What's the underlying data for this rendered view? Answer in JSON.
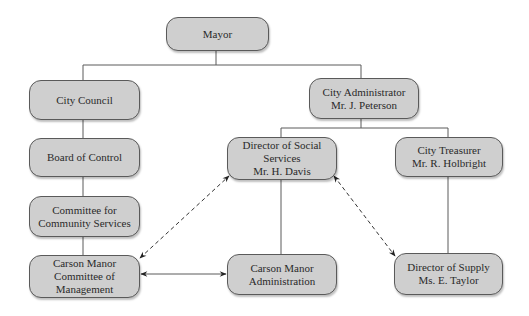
{
  "diagram": {
    "type": "organizational-chart",
    "colors": {
      "box_fill": "#cfcfcf",
      "box_border": "#5a5a5a",
      "line": "#5a5a5a",
      "text": "#2a2a2a",
      "background": "#ffffff"
    },
    "nodes": [
      {
        "id": "mayor",
        "lines": [
          "Mayor"
        ],
        "x": 166,
        "y": 17,
        "w": 103,
        "h": 34
      },
      {
        "id": "city-council",
        "lines": [
          "City Council"
        ],
        "x": 29,
        "y": 80,
        "w": 111,
        "h": 40
      },
      {
        "id": "city-administrator",
        "lines": [
          "City Administrator",
          "Mr. J. Peterson"
        ],
        "x": 309,
        "y": 78,
        "w": 110,
        "h": 41
      },
      {
        "id": "board-of-control",
        "lines": [
          "Board of Control"
        ],
        "x": 29,
        "y": 138,
        "w": 111,
        "h": 39
      },
      {
        "id": "director-social-services",
        "lines": [
          "Director of Social",
          "Services",
          "Mr. H. Davis"
        ],
        "x": 227,
        "y": 137,
        "w": 110,
        "h": 43
      },
      {
        "id": "city-treasurer",
        "lines": [
          "City Treasurer",
          "Mr. R. Holbright"
        ],
        "x": 395,
        "y": 137,
        "w": 108,
        "h": 40
      },
      {
        "id": "committee-community-services",
        "lines": [
          "Committee for",
          "Community Services"
        ],
        "x": 29,
        "y": 196,
        "w": 111,
        "h": 41
      },
      {
        "id": "carson-manor-committee",
        "lines": [
          "Carson Manor",
          "Committee of",
          "Management"
        ],
        "x": 29,
        "y": 255,
        "w": 111,
        "h": 43
      },
      {
        "id": "carson-manor-administration",
        "lines": [
          "Carson Manor",
          "Administration"
        ],
        "x": 227,
        "y": 254,
        "w": 110,
        "h": 41
      },
      {
        "id": "director-of-supply",
        "lines": [
          "Director of Supply",
          "Ms. E. Taylor"
        ],
        "x": 394,
        "y": 253,
        "w": 109,
        "h": 42
      }
    ],
    "connectors": [
      {
        "from": "mayor",
        "to": "city-council",
        "style": "solid",
        "points": [
          [
            216,
            51
          ],
          [
            216,
            65
          ],
          [
            83,
            65
          ],
          [
            83,
            80
          ]
        ]
      },
      {
        "from": "mayor",
        "to": "city-administrator",
        "style": "solid",
        "points": [
          [
            216,
            65
          ],
          [
            361,
            65
          ],
          [
            361,
            78
          ]
        ]
      },
      {
        "from": "city-council",
        "to": "board-of-control",
        "style": "solid",
        "points": [
          [
            83,
            120
          ],
          [
            83,
            138
          ]
        ]
      },
      {
        "from": "board-of-control",
        "to": "committee-community-services",
        "style": "solid",
        "points": [
          [
            83,
            177
          ],
          [
            83,
            196
          ]
        ]
      },
      {
        "from": "committee-community-services",
        "to": "carson-manor-committee",
        "style": "solid",
        "points": [
          [
            83,
            237
          ],
          [
            83,
            255
          ]
        ]
      },
      {
        "from": "city-administrator",
        "to": "director-social-services",
        "style": "solid",
        "points": [
          [
            361,
            119
          ],
          [
            361,
            128
          ],
          [
            281,
            128
          ],
          [
            281,
            137
          ]
        ]
      },
      {
        "from": "city-administrator",
        "to": "city-treasurer",
        "style": "solid",
        "points": [
          [
            361,
            128
          ],
          [
            448,
            128
          ],
          [
            448,
            137
          ]
        ]
      },
      {
        "from": "director-social-services",
        "to": "carson-manor-administration",
        "style": "solid",
        "points": [
          [
            281,
            180
          ],
          [
            281,
            254
          ]
        ]
      },
      {
        "from": "city-treasurer",
        "to": "director-of-supply",
        "style": "solid",
        "points": [
          [
            448,
            177
          ],
          [
            448,
            253
          ]
        ]
      }
    ],
    "relations": [
      {
        "between": [
          "carson-manor-committee",
          "carson-manor-administration"
        ],
        "style": "solid",
        "arrows": "both",
        "x1": 141,
        "y1": 274,
        "x2": 226,
        "y2": 274
      },
      {
        "between": [
          "carson-manor-committee",
          "director-social-services"
        ],
        "style": "dashed",
        "arrows": "both",
        "x1": 140,
        "y1": 258,
        "x2": 229,
        "y2": 176
      },
      {
        "between": [
          "director-social-services",
          "director-of-supply"
        ],
        "style": "dashed",
        "arrows": "both",
        "x1": 334,
        "y1": 176,
        "x2": 395,
        "y2": 256
      }
    ]
  }
}
